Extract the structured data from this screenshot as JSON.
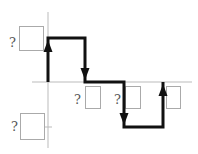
{
  "diagram": {
    "type": "step-function-graph",
    "colors": {
      "path": "#111111",
      "axis": "#bbbbbb",
      "box_border": "#aaaaaa",
      "label": "#555555"
    },
    "axes": {
      "y_axis": {
        "x": 48,
        "y1": 12,
        "y2": 148
      },
      "x_axis": {
        "y": 82,
        "x1": 32,
        "x2": 192
      },
      "y_tick_lower": {
        "y": 127
      }
    },
    "path_points": [
      [
        48,
        82
      ],
      [
        48,
        38
      ],
      [
        85,
        38
      ],
      [
        85,
        82
      ],
      [
        124,
        82
      ],
      [
        124,
        127
      ],
      [
        163,
        127
      ],
      [
        163,
        82
      ]
    ],
    "arrows": [
      {
        "direction": "up",
        "x": 48,
        "tip_y": 40
      },
      {
        "direction": "down",
        "x": 85,
        "tip_y": 80
      },
      {
        "direction": "down",
        "x": 124,
        "tip_y": 125
      },
      {
        "direction": "up",
        "x": 163,
        "tip_y": 84
      }
    ],
    "boxes": [
      {
        "id": "y-top",
        "label": "?",
        "x": 19,
        "y": 26,
        "w": 24,
        "h": 24,
        "label_x": 9,
        "label_y": 47
      },
      {
        "id": "y-bottom",
        "label": "?",
        "x": 20,
        "y": 113,
        "w": 24,
        "h": 26,
        "label_x": 11,
        "label_y": 131
      },
      {
        "id": "x-1",
        "label": "?",
        "x": 85,
        "y": 86,
        "w": 15,
        "h": 22,
        "label_x": 74,
        "label_y": 104
      },
      {
        "id": "x-2",
        "label": "?",
        "x": 125,
        "y": 86,
        "w": 15,
        "h": 22,
        "label_x": 114,
        "label_y": 104
      },
      {
        "id": "x-3",
        "label": "",
        "x": 166,
        "y": 86,
        "w": 14,
        "h": 22,
        "label_x": 0,
        "label_y": 0
      }
    ]
  }
}
